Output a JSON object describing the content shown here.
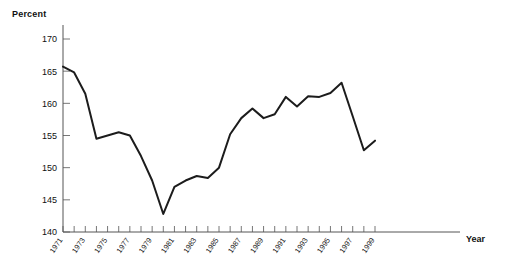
{
  "chart_data": {
    "type": "line",
    "title": "",
    "subtitle": "",
    "xlabel": "Year",
    "ylabel": "Percent",
    "ylim": [
      140,
      170
    ],
    "xlim": [
      1971,
      1999
    ],
    "ytick_labels": [
      "140",
      "145",
      "150",
      "155",
      "160",
      "165",
      "170"
    ],
    "ytick_values": [
      140,
      145,
      150,
      155,
      160,
      165,
      170
    ],
    "xtick_labels": [
      "1971",
      "1973",
      "1975",
      "1977",
      "1979",
      "1981",
      "1983",
      "1985",
      "1987",
      "1989",
      "1991",
      "1993",
      "1995",
      "1997",
      "1999"
    ],
    "xtick_values": [
      1971,
      1973,
      1975,
      1977,
      1979,
      1981,
      1983,
      1985,
      1987,
      1989,
      1991,
      1993,
      1995,
      1997,
      1999
    ],
    "minor_ticks_every": 1,
    "grid": false,
    "legend": false,
    "legend_position": "none",
    "line_color": "#1c1c1c",
    "axis_color": "#555555",
    "x": [
      1971,
      1972,
      1973,
      1974,
      1975,
      1976,
      1977,
      1978,
      1979,
      1980,
      1981,
      1982,
      1983,
      1984,
      1985,
      1986,
      1987,
      1988,
      1989,
      1990,
      1991,
      1992,
      1993,
      1994,
      1995,
      1996,
      1997,
      1998,
      1999
    ],
    "values": [
      165.7,
      164.8,
      161.5,
      154.5,
      155.0,
      155.5,
      155.0,
      151.8,
      148.0,
      142.8,
      147.0,
      148.0,
      148.7,
      148.4,
      150.0,
      155.2,
      157.7,
      159.2,
      157.7,
      158.3,
      161.0,
      159.5,
      161.1,
      161.0,
      161.6,
      163.2,
      158.0,
      152.7,
      154.2
    ],
    "series": [
      {
        "name": "Percent",
        "values": [
          165.7,
          164.8,
          161.5,
          154.5,
          155.0,
          155.5,
          155.0,
          151.8,
          148.0,
          142.8,
          147.0,
          148.0,
          148.7,
          148.4,
          150.0,
          155.2,
          157.7,
          159.2,
          157.7,
          158.3,
          161.0,
          159.5,
          161.1,
          161.0,
          161.6,
          163.2,
          158.0,
          152.7,
          154.2
        ]
      }
    ],
    "annotations": []
  },
  "labels": {
    "y_axis_title": "Percent",
    "x_axis_title": "Year"
  }
}
